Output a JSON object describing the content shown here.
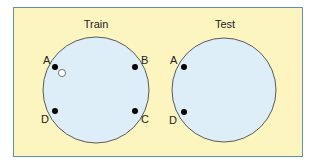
{
  "diagram": {
    "colors": {
      "background": "#fdf5c0",
      "border": "#5f8fb5",
      "circle_fill": "#ddeef8",
      "circle_stroke": "#333333",
      "filled_dot": "#000000",
      "hollow_dot_fill": "#ffffff"
    },
    "panels": [
      {
        "title": "Train",
        "labels": {
          "A": "A",
          "B": "B",
          "C": "C",
          "D": "D"
        },
        "points": [
          "A",
          "B",
          "C",
          "D"
        ],
        "extra": "hollow point near A"
      },
      {
        "title": "Test",
        "labels": {
          "A": "A",
          "D": "D"
        },
        "points": [
          "A",
          "D"
        ]
      }
    ]
  }
}
